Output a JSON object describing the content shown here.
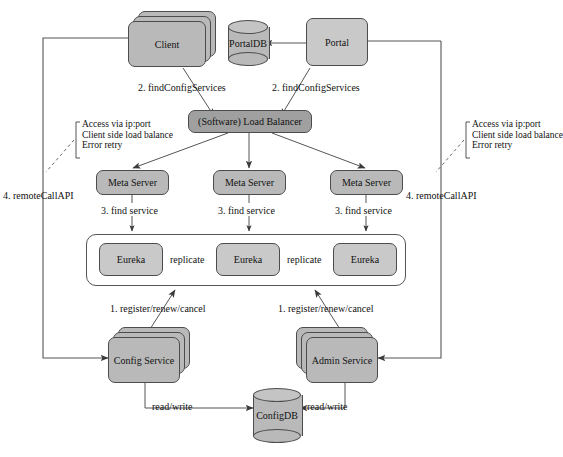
{
  "diagram": {
    "nodes": {
      "client": "Client",
      "portal": "Portal",
      "portaldb": "PortalDB",
      "load_balancer": "(Software) Load Balancer",
      "meta_server_1": "Meta Server",
      "meta_server_2": "Meta Server",
      "meta_server_3": "Meta Server",
      "eureka_1": "Eureka",
      "eureka_2": "Eureka",
      "eureka_3": "Eureka",
      "config_service": "Config Service",
      "admin_service": "Admin Service",
      "configdb": "ConfigDB"
    },
    "edge_labels": {
      "find_config_services_left": "2. findConfigServices",
      "find_config_services_right": "2. findConfigServices",
      "find_service_1": "3. find service",
      "find_service_2": "3. find service",
      "find_service_3": "3. find service",
      "replicate_left": "replicate",
      "replicate_right": "replicate",
      "register_left": "1. register/renew/cancel",
      "register_right": "1. register/renew/cancel",
      "remote_call_api_left": "4. remoteCallAPI",
      "remote_call_api_right": "4. remoteCallAPI",
      "read_write_left": "read/write",
      "read_write_right": "read/write"
    },
    "annotations": {
      "left_note": {
        "line1": "Access via ip:port",
        "line2": "Client side load balance",
        "line3": "Error retry"
      },
      "right_note": {
        "line1": "Access via ip:port",
        "line2": "Client side load balance",
        "line3": "Error retry"
      }
    },
    "colors": {
      "node_fill": "#b9b9b9",
      "node_fill_dark": "#a0a0a0",
      "node_fill_light": "#c9c9c9",
      "stroke": "#4c4c4c",
      "line": "#555555",
      "text": "#111111",
      "background": "#ffffff"
    }
  }
}
